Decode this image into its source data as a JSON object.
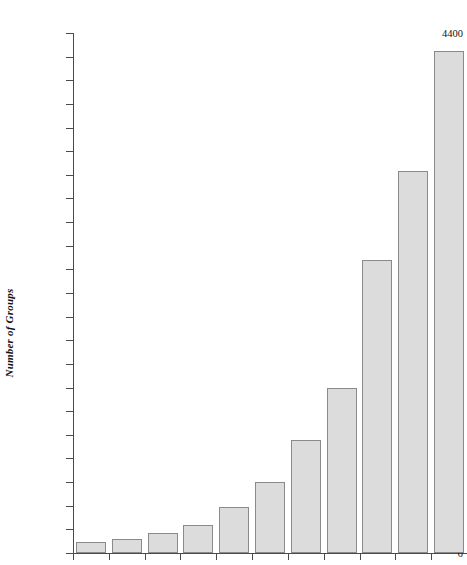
{
  "chart_data": {
    "type": "bar",
    "title": "",
    "xlabel": "",
    "ylabel": "Number of Groups",
    "ylim": [
      0,
      4400
    ],
    "ytick_step": 200,
    "grid": false,
    "legend": null,
    "categories": [
      "1",
      "2",
      "3",
      "4",
      "5",
      "6",
      "7",
      "8",
      "9",
      "10",
      "11"
    ],
    "values": [
      90,
      115,
      170,
      240,
      390,
      600,
      960,
      1400,
      2480,
      3230,
      4250
    ],
    "yticks": [
      "0",
      "200",
      "400",
      "600",
      "800",
      "1000",
      "1200",
      "1400",
      "1600",
      "1800",
      "2000",
      "2200",
      "2400",
      "2600",
      "2800",
      "3000",
      "3200",
      "3400",
      "3600",
      "3800",
      "4000",
      "4200",
      "4400"
    ],
    "xtick_labels": [
      "",
      "",
      "",
      "",
      "",
      "",
      "",
      "",
      "",
      "",
      ""
    ],
    "bar_fill": "#dcdcdc",
    "bar_stroke": "#8a8a8a",
    "axis_color": "#4a4a4a"
  }
}
